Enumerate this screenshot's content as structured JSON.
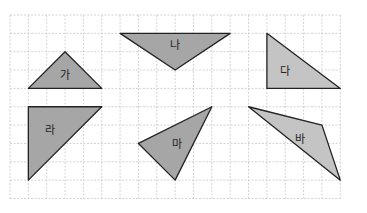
{
  "grid": {
    "origin_x": 10,
    "origin_y": 15,
    "cell": 18.35,
    "cols": 18,
    "rows": 10,
    "line_color": "#c8c8c8"
  },
  "shapes": [
    {
      "label": "가",
      "fill": "#a6a6a6",
      "points": [
        [
          1,
          4
        ],
        [
          3,
          2
        ],
        [
          5,
          4
        ]
      ],
      "label_pos": [
        3,
        3.3
      ]
    },
    {
      "label": "나",
      "fill": "#a6a6a6",
      "points": [
        [
          6,
          1
        ],
        [
          12,
          1
        ],
        [
          9,
          3
        ]
      ],
      "label_pos": [
        9,
        1.7
      ]
    },
    {
      "label": "다",
      "fill": "#c4c4c4",
      "points": [
        [
          14,
          1
        ],
        [
          14,
          4
        ],
        [
          18,
          4
        ]
      ],
      "label_pos": [
        15,
        3.1
      ]
    },
    {
      "label": "라",
      "fill": "#a6a6a6",
      "points": [
        [
          1,
          5
        ],
        [
          5,
          5
        ],
        [
          1,
          9
        ]
      ],
      "label_pos": [
        2.2,
        6.3
      ]
    },
    {
      "label": "마",
      "fill": "#a6a6a6",
      "points": [
        [
          11,
          5
        ],
        [
          7,
          7
        ],
        [
          9,
          9
        ]
      ],
      "label_pos": [
        9.1,
        7.1
      ]
    },
    {
      "label": "바",
      "fill": "#c4c4c4",
      "points": [
        [
          13,
          5
        ],
        [
          17,
          6
        ],
        [
          18,
          9
        ]
      ],
      "label_pos": [
        15.8,
        6.8
      ]
    }
  ],
  "stroke_color": "#222222"
}
